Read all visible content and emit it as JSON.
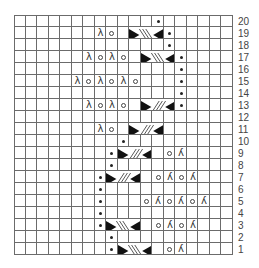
{
  "chart": {
    "columns": 19,
    "rows": 20,
    "row_numbers": [
      "20",
      "19",
      "18",
      "17",
      "16",
      "15",
      "14",
      "13",
      "12",
      "11",
      "10",
      "9",
      "8",
      "7",
      "6",
      "5",
      "4",
      "3",
      "2",
      "1"
    ],
    "symbols": {
      "dot": "purl",
      "yo": "yarn over (o)",
      "k2tog": "λ",
      "ssk": "λ (mirrored)",
      "cable_right": "cable crossing, stripes \\ direction",
      "cable_left": "cable crossing, stripes / direction"
    },
    "colors": {
      "grid_line": "#6b6b6b",
      "symbol": "#222222",
      "background": "#ffffff"
    },
    "stitches": [
      {
        "row": 20,
        "col": 13,
        "type": "dot"
      },
      {
        "row": 19,
        "col": 8,
        "type": "k2tog"
      },
      {
        "row": 19,
        "col": 9,
        "type": "yo"
      },
      {
        "row": 19,
        "col": 14,
        "type": "dot"
      },
      {
        "row": 18,
        "col": 14,
        "type": "dot"
      },
      {
        "row": 17,
        "col": 7,
        "type": "k2tog"
      },
      {
        "row": 17,
        "col": 8,
        "type": "yo"
      },
      {
        "row": 17,
        "col": 9,
        "type": "k2tog"
      },
      {
        "row": 17,
        "col": 10,
        "type": "yo"
      },
      {
        "row": 17,
        "col": 15,
        "type": "dot"
      },
      {
        "row": 16,
        "col": 15,
        "type": "dot"
      },
      {
        "row": 15,
        "col": 6,
        "type": "k2tog"
      },
      {
        "row": 15,
        "col": 7,
        "type": "yo"
      },
      {
        "row": 15,
        "col": 8,
        "type": "k2tog"
      },
      {
        "row": 15,
        "col": 9,
        "type": "yo"
      },
      {
        "row": 15,
        "col": 10,
        "type": "k2tog"
      },
      {
        "row": 15,
        "col": 11,
        "type": "yo"
      },
      {
        "row": 15,
        "col": 15,
        "type": "dot"
      },
      {
        "row": 14,
        "col": 15,
        "type": "dot"
      },
      {
        "row": 13,
        "col": 7,
        "type": "k2tog"
      },
      {
        "row": 13,
        "col": 8,
        "type": "yo"
      },
      {
        "row": 13,
        "col": 9,
        "type": "k2tog"
      },
      {
        "row": 13,
        "col": 10,
        "type": "yo"
      },
      {
        "row": 13,
        "col": 15,
        "type": "dot"
      },
      {
        "row": 11,
        "col": 8,
        "type": "k2tog"
      },
      {
        "row": 11,
        "col": 9,
        "type": "yo"
      },
      {
        "row": 10,
        "col": 10,
        "type": "dot"
      },
      {
        "row": 9,
        "col": 9,
        "type": "dot"
      },
      {
        "row": 9,
        "col": 14,
        "type": "yo"
      },
      {
        "row": 9,
        "col": 15,
        "type": "ssk"
      },
      {
        "row": 8,
        "col": 9,
        "type": "dot"
      },
      {
        "row": 7,
        "col": 8,
        "type": "dot"
      },
      {
        "row": 7,
        "col": 13,
        "type": "yo"
      },
      {
        "row": 7,
        "col": 14,
        "type": "ssk"
      },
      {
        "row": 7,
        "col": 15,
        "type": "yo"
      },
      {
        "row": 7,
        "col": 16,
        "type": "ssk"
      },
      {
        "row": 6,
        "col": 8,
        "type": "dot"
      },
      {
        "row": 5,
        "col": 8,
        "type": "dot"
      },
      {
        "row": 5,
        "col": 12,
        "type": "yo"
      },
      {
        "row": 5,
        "col": 13,
        "type": "ssk"
      },
      {
        "row": 5,
        "col": 14,
        "type": "yo"
      },
      {
        "row": 5,
        "col": 15,
        "type": "ssk"
      },
      {
        "row": 5,
        "col": 16,
        "type": "yo"
      },
      {
        "row": 5,
        "col": 17,
        "type": "ssk"
      },
      {
        "row": 4,
        "col": 8,
        "type": "dot"
      },
      {
        "row": 3,
        "col": 8,
        "type": "dot"
      },
      {
        "row": 3,
        "col": 13,
        "type": "yo"
      },
      {
        "row": 3,
        "col": 14,
        "type": "ssk"
      },
      {
        "row": 3,
        "col": 15,
        "type": "yo"
      },
      {
        "row": 3,
        "col": 16,
        "type": "ssk"
      },
      {
        "row": 2,
        "col": 9,
        "type": "dot"
      },
      {
        "row": 1,
        "col": 9,
        "type": "dot"
      },
      {
        "row": 1,
        "col": 14,
        "type": "yo"
      },
      {
        "row": 1,
        "col": 15,
        "type": "ssk"
      }
    ],
    "cables": [
      {
        "row": 19,
        "col_start": 11,
        "col_end": 13,
        "direction": "back"
      },
      {
        "row": 17,
        "col_start": 12,
        "col_end": 14,
        "direction": "back"
      },
      {
        "row": 13,
        "col_start": 12,
        "col_end": 14,
        "direction": "forward"
      },
      {
        "row": 11,
        "col_start": 11,
        "col_end": 13,
        "direction": "forward"
      },
      {
        "row": 9,
        "col_start": 10,
        "col_end": 12,
        "direction": "forward"
      },
      {
        "row": 7,
        "col_start": 9,
        "col_end": 11,
        "direction": "forward"
      },
      {
        "row": 3,
        "col_start": 9,
        "col_end": 11,
        "direction": "back"
      },
      {
        "row": 1,
        "col_start": 10,
        "col_end": 12,
        "direction": "back"
      }
    ]
  }
}
